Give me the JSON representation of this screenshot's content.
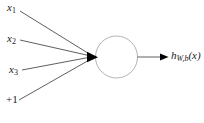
{
  "diagram": {
    "type": "single-neuron-network",
    "inputs": [
      {
        "base": "x",
        "sub": "1"
      },
      {
        "base": "x",
        "sub": "2"
      },
      {
        "base": "x",
        "sub": "3"
      },
      {
        "base": "+1",
        "sub": ""
      }
    ],
    "output_label": {
      "base": "h",
      "sub": "W,b",
      "suffix": "(x)"
    },
    "colors": {
      "background": "#ffffff",
      "line": "#4d4d4d",
      "arrowhead": "#000000",
      "neuron_stroke": "#b3b3b3",
      "neuron_fill": "#ffffff",
      "text": "#1a1a1a"
    }
  }
}
